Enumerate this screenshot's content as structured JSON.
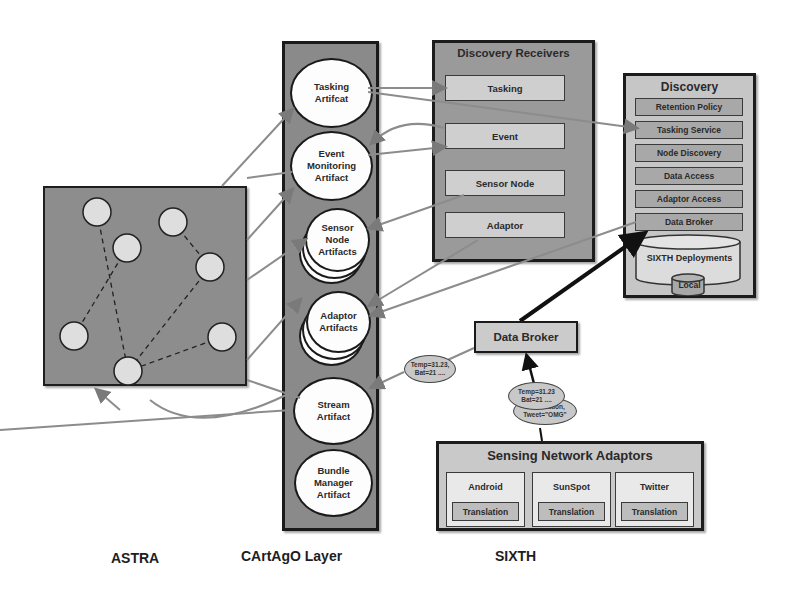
{
  "astra": {
    "label": "ASTRA",
    "agents": [
      {
        "x": 97,
        "y": 212
      },
      {
        "x": 173,
        "y": 222
      },
      {
        "x": 127,
        "y": 248
      },
      {
        "x": 210,
        "y": 267
      },
      {
        "x": 74,
        "y": 336
      },
      {
        "x": 222,
        "y": 337
      },
      {
        "x": 128,
        "y": 371
      }
    ]
  },
  "cartago": {
    "label": "CArtAgO Layer",
    "artifacts": [
      {
        "name": "Tasking\nArtifcat",
        "stacked": false
      },
      {
        "name": "Event\nMonitoring\nArtifact",
        "stacked": false
      },
      {
        "name": "Sensor\nNode\nArtifacts",
        "stacked": true
      },
      {
        "name": "Adaptor\nArtifacts",
        "stacked": true
      },
      {
        "name": "Stream\nArtifact",
        "stacked": false
      },
      {
        "name": "Bundle\nManager\nArtifact",
        "stacked": false
      }
    ]
  },
  "receivers": {
    "title": "Discovery Receivers",
    "items": [
      "Tasking",
      "Event",
      "Sensor Node",
      "Adaptor"
    ]
  },
  "discovery": {
    "title": "Discovery",
    "items": [
      "Retention Policy",
      "Tasking Service",
      "Node Discovery",
      "Data Access",
      "Adaptor Access",
      "Data Broker"
    ],
    "db_label": "SIXTH Deployments",
    "local_label": "Local"
  },
  "broker": {
    "label": "Data Broker"
  },
  "messages": {
    "stream_msg": "Temp=31.23,\nBat=21 ....",
    "adaptor_msg_front": "Temp=31.23\nBat=21 ....",
    "adaptor_msg_back": "Observation,\nTweet=\"OMG\""
  },
  "sna": {
    "title": "Sensing Network Adaptors",
    "adaptors": [
      {
        "name": "Android",
        "translation": "Translation"
      },
      {
        "name": "SunSpot",
        "translation": "Translation"
      },
      {
        "name": "Twitter",
        "translation": "Translation"
      }
    ]
  },
  "sixth": {
    "label": "SIXTH"
  },
  "colors": {
    "panel_dark": "#8a8a8a",
    "panel_light": "#c6c6c6",
    "connector": "#8c8c8c",
    "thick_arrow": "#1a1a1a"
  }
}
